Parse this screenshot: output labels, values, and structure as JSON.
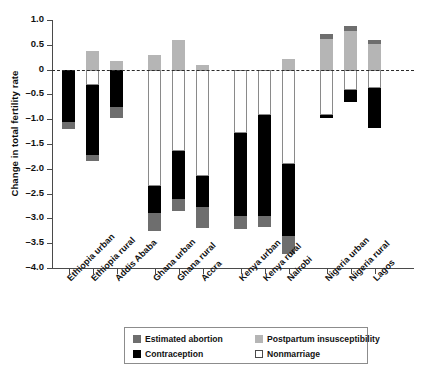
{
  "chart_data": {
    "type": "bar",
    "subtype": "stacked-bar-diverging",
    "title": "",
    "xlabel": "",
    "ylabel": "Change in total fertility rate",
    "ylim": [
      -4.0,
      1.0
    ],
    "yticks": [
      1.0,
      0.5,
      0,
      -0.5,
      -1.0,
      -1.5,
      -2.0,
      -2.5,
      -3.0,
      -3.5,
      -4.0
    ],
    "ytick_labels": [
      "1.0",
      "0.5",
      "0",
      "–0.5",
      "–1.0",
      "–1.5",
      "–2.0",
      "–2.5",
      "–3.0",
      "–3.5",
      "–4.0"
    ],
    "grid": false,
    "zero_reference_line": true,
    "legend_position": "bottom",
    "categories": [
      "Ethiopia urban",
      "Ethiopia rural",
      "Addis Ababa",
      "Ghana urban",
      "Ghana rural",
      "Accra",
      "Kenya urban",
      "Kenya rural",
      "Nairobi",
      "Nigeria urban",
      "Nigeria rural",
      "Lagos"
    ],
    "series": [
      {
        "name": "Estimated abortion",
        "color": "#6e6e6e",
        "values": [
          -0.15,
          -0.13,
          -0.22,
          -0.36,
          -0.25,
          -0.42,
          -0.27,
          -0.23,
          -0.37,
          -0.1,
          -0.1,
          -0.08
        ]
      },
      {
        "name": "Postpartum insusceptibility",
        "color": "#b5b5b5",
        "values": [
          0.0,
          0.38,
          0.17,
          0.3,
          0.6,
          0.1,
          0.0,
          0.0,
          0.22,
          0.62,
          0.78,
          0.52
        ]
      },
      {
        "name": "Contraception",
        "color": "#000000",
        "values": [
          -1.05,
          -1.4,
          -0.75,
          -0.55,
          -0.96,
          -0.62,
          -1.67,
          -2.03,
          -1.45,
          -0.05,
          -0.23,
          -0.8
        ]
      },
      {
        "name": "Nonmarriage",
        "color": "#ffffff",
        "values": [
          0.0,
          -0.32,
          0.0,
          -2.35,
          -1.65,
          -2.15,
          -1.28,
          -0.92,
          -1.9,
          -0.92,
          -0.42,
          -0.38
        ]
      }
    ],
    "bar_segments": [
      {
        "category": "Ethiopia urban",
        "segments": [
          {
            "series": "Contraception",
            "from": 0.0,
            "to": -1.05
          },
          {
            "series": "Estimated abortion",
            "from": -1.05,
            "to": -1.2
          }
        ],
        "total": -1.2
      },
      {
        "category": "Ethiopia rural",
        "segments": [
          {
            "series": "Postpartum insusceptibility",
            "from": 0.38,
            "to": 0.0
          },
          {
            "series": "Nonmarriage",
            "from": 0.0,
            "to": -0.32
          },
          {
            "series": "Contraception",
            "from": -0.32,
            "to": -1.72
          },
          {
            "series": "Estimated abortion",
            "from": -1.72,
            "to": -1.85
          }
        ],
        "total": -1.47
      },
      {
        "category": "Addis Ababa",
        "segments": [
          {
            "series": "Postpartum insusceptibility",
            "from": 0.17,
            "to": 0.0
          },
          {
            "series": "Contraception",
            "from": 0.0,
            "to": -0.75
          },
          {
            "series": "Estimated abortion",
            "from": -0.75,
            "to": -0.97
          }
        ],
        "total": -0.8
      },
      {
        "category": "Ghana urban",
        "segments": [
          {
            "series": "Postpartum insusceptibility",
            "from": 0.3,
            "to": 0.0
          },
          {
            "series": "Nonmarriage",
            "from": 0.0,
            "to": -2.35
          },
          {
            "series": "Contraception",
            "from": -2.35,
            "to": -2.9
          },
          {
            "series": "Estimated abortion",
            "from": -2.9,
            "to": -3.26
          }
        ],
        "total": -2.96
      },
      {
        "category": "Ghana rural",
        "segments": [
          {
            "series": "Postpartum insusceptibility",
            "from": 0.6,
            "to": 0.0
          },
          {
            "series": "Nonmarriage",
            "from": 0.0,
            "to": -1.65
          },
          {
            "series": "Contraception",
            "from": -1.65,
            "to": -2.61
          },
          {
            "series": "Estimated abortion",
            "from": -2.61,
            "to": -2.86
          }
        ],
        "total": -2.26
      },
      {
        "category": "Accra",
        "segments": [
          {
            "series": "Postpartum insusceptibility",
            "from": 0.1,
            "to": 0.0
          },
          {
            "series": "Nonmarriage",
            "from": 0.0,
            "to": -2.15
          },
          {
            "series": "Contraception",
            "from": -2.15,
            "to": -2.77
          },
          {
            "series": "Estimated abortion",
            "from": -2.77,
            "to": -3.19
          }
        ],
        "total": -3.09
      },
      {
        "category": "Kenya urban",
        "segments": [
          {
            "series": "Nonmarriage",
            "from": 0.0,
            "to": -1.28
          },
          {
            "series": "Contraception",
            "from": -1.28,
            "to": -2.95
          },
          {
            "series": "Estimated abortion",
            "from": -2.95,
            "to": -3.22
          }
        ],
        "total": -3.22
      },
      {
        "category": "Kenya rural",
        "segments": [
          {
            "series": "Nonmarriage",
            "from": 0.0,
            "to": -0.92
          },
          {
            "series": "Contraception",
            "from": -0.92,
            "to": -2.95
          },
          {
            "series": "Estimated abortion",
            "from": -2.95,
            "to": -3.18
          }
        ],
        "total": -3.18
      },
      {
        "category": "Nairobi",
        "segments": [
          {
            "series": "Postpartum insusceptibility",
            "from": 0.22,
            "to": 0.0
          },
          {
            "series": "Nonmarriage",
            "from": 0.0,
            "to": -1.9
          },
          {
            "series": "Contraception",
            "from": -1.9,
            "to": -3.35
          },
          {
            "series": "Estimated abortion",
            "from": -3.35,
            "to": -3.72
          }
        ],
        "total": -3.5
      },
      {
        "category": "Nigeria urban",
        "segments": [
          {
            "series": "Estimated abortion",
            "from": 0.72,
            "to": 0.62
          },
          {
            "series": "Postpartum insusceptibility",
            "from": 0.62,
            "to": 0.0
          },
          {
            "series": "Nonmarriage",
            "from": 0.0,
            "to": -0.92
          },
          {
            "series": "Contraception",
            "from": -0.92,
            "to": -0.97
          }
        ],
        "total": -0.25
      },
      {
        "category": "Nigeria rural",
        "segments": [
          {
            "series": "Estimated abortion",
            "from": 0.88,
            "to": 0.78
          },
          {
            "series": "Postpartum insusceptibility",
            "from": 0.78,
            "to": 0.0
          },
          {
            "series": "Nonmarriage",
            "from": 0.0,
            "to": -0.42
          },
          {
            "series": "Contraception",
            "from": -0.42,
            "to": -0.65
          }
        ],
        "total": 0.23
      },
      {
        "category": "Lagos",
        "segments": [
          {
            "series": "Estimated abortion",
            "from": 0.6,
            "to": 0.52
          },
          {
            "series": "Postpartum insusceptibility",
            "from": 0.52,
            "to": 0.0
          },
          {
            "series": "Nonmarriage",
            "from": 0.0,
            "to": -0.38
          },
          {
            "series": "Contraception",
            "from": -0.38,
            "to": -1.18
          }
        ],
        "total": -0.58
      }
    ],
    "legend": [
      {
        "label": "Estimated abortion",
        "color": "#6e6e6e",
        "swatch": "abortion"
      },
      {
        "label": "Postpartum insusceptibility",
        "color": "#b5b5b5",
        "swatch": "postpartum"
      },
      {
        "label": "Contraception",
        "color": "#000000",
        "swatch": "contraception"
      },
      {
        "label": "Nonmarriage",
        "color": "#ffffff",
        "swatch": "nonmarriage"
      }
    ]
  }
}
